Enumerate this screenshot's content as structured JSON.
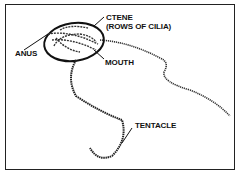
{
  "diagram": {
    "labels": {
      "ctene_line1": "CTENE",
      "ctene_line2": "(ROWS OF CILIA)",
      "anus": "ANUS",
      "mouth": "MOUTH",
      "tentacle": "TENTACLE"
    },
    "colors": {
      "ink": "#111111",
      "background": "#ffffff"
    }
  }
}
